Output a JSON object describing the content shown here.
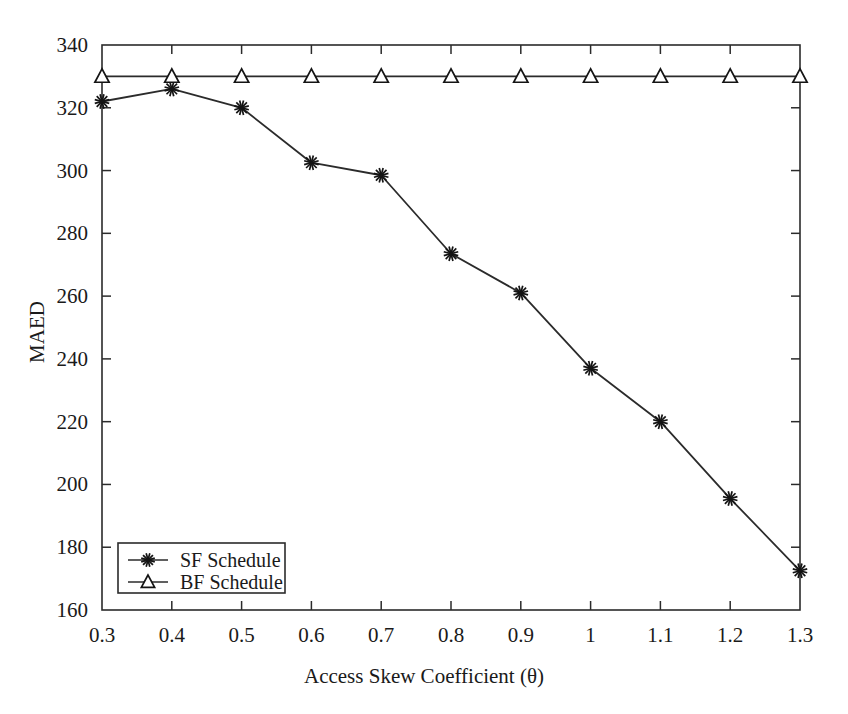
{
  "chart_data": {
    "type": "line",
    "title": "",
    "xlabel": "Access Skew Coefficient (θ)",
    "ylabel": "MAED",
    "x": [
      0.3,
      0.4,
      0.5,
      0.6,
      0.7,
      0.8,
      0.9,
      1.0,
      1.1,
      1.2,
      1.3
    ],
    "xtick_labels": [
      "0.3",
      "0.4",
      "0.5",
      "0.6",
      "0.7",
      "0.8",
      "0.9",
      "1",
      "1.1",
      "1.2",
      "1.3"
    ],
    "ytick_labels": [
      "160",
      "180",
      "200",
      "220",
      "240",
      "260",
      "280",
      "300",
      "320",
      "340"
    ],
    "yticks": [
      160,
      180,
      200,
      220,
      240,
      260,
      280,
      300,
      320,
      340
    ],
    "xlim": [
      0.3,
      1.3
    ],
    "ylim": [
      160,
      340
    ],
    "grid": false,
    "legend_position": "lower-left-inside",
    "series": [
      {
        "name": "SF Schedule",
        "marker": "star-asterisk",
        "color": "#2b2b2b",
        "values": [
          322,
          326,
          320,
          302.5,
          298.5,
          273.5,
          261,
          237,
          220,
          195.5,
          172.5
        ]
      },
      {
        "name": "BF Schedule",
        "marker": "triangle-up",
        "color": "#2b2b2b",
        "values": [
          330,
          330,
          330,
          330,
          330,
          330,
          330,
          330,
          330,
          330,
          330
        ]
      }
    ]
  },
  "legend": {
    "entries": [
      {
        "label": "SF Schedule",
        "marker": "star-asterisk"
      },
      {
        "label": "BF Schedule",
        "marker": "triangle-up"
      }
    ]
  },
  "axes": {
    "x_axis_title": "Access Skew Coefficient (θ)",
    "y_axis_title": "MAED"
  }
}
